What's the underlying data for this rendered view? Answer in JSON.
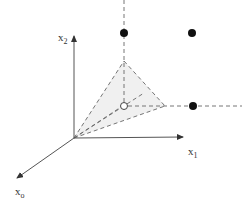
{
  "diagram": {
    "type": "3d-coordinate-sketch",
    "axes": {
      "x0": {
        "label": "x",
        "subscript": "o"
      },
      "x1": {
        "label": "x",
        "subscript": "1"
      },
      "x2": {
        "label": "x",
        "subscript": "2"
      }
    },
    "points": {
      "filled": [
        {
          "name": "top-vertical-dot"
        },
        {
          "name": "top-right-dot"
        },
        {
          "name": "right-horizontal-dot"
        }
      ],
      "open": [
        {
          "name": "center-open-circle"
        }
      ]
    },
    "shaded_region": "tetrahedral cone from origin",
    "colors": {
      "axis": "#555555",
      "dash": "#666666",
      "fill": "#f0f0f0",
      "dot": "#111111"
    }
  }
}
